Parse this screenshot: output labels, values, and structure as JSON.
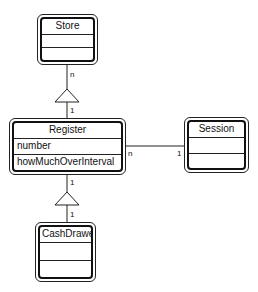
{
  "diagram": {
    "type": "UML class diagram",
    "classes": [
      {
        "id": "store",
        "name": "Store",
        "attributes": [],
        "operations": []
      },
      {
        "id": "register",
        "name": "Register",
        "attributes": [
          "number"
        ],
        "operations": [
          "howMuchOverInterval"
        ]
      },
      {
        "id": "session",
        "name": "Session",
        "attributes": [],
        "operations": []
      },
      {
        "id": "cashdrawer",
        "name": "CashDrawer",
        "attributes": [],
        "operations": []
      }
    ],
    "relationships": [
      {
        "from": "register",
        "to": "store",
        "kind": "generalization",
        "mult_from": "1",
        "mult_to": "n"
      },
      {
        "from": "cashdrawer",
        "to": "register",
        "kind": "generalization",
        "mult_from": "1",
        "mult_to": "1"
      },
      {
        "from": "register",
        "to": "session",
        "kind": "association",
        "mult_from": "n",
        "mult_to": "1"
      }
    ]
  },
  "labels": {
    "store_register_top": "n",
    "store_register_bottom": "1",
    "register_cash_top": "1",
    "register_cash_bottom": "1",
    "register_session_left": "n",
    "register_session_right": "1"
  }
}
